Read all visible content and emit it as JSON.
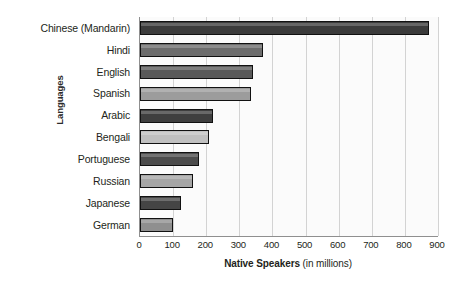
{
  "chart_data": {
    "type": "bar",
    "orientation": "horizontal",
    "title": "",
    "xlabel_bold": "Native Speakers",
    "xlabel_light": "(in millions)",
    "ylabel": "Languages",
    "xlim": [
      0,
      900
    ],
    "xticks": [
      0,
      100,
      200,
      300,
      400,
      500,
      600,
      700,
      800,
      900
    ],
    "xtick_labels": [
      "0",
      "100",
      "200",
      "300",
      "400",
      "500",
      "600",
      "700",
      "800",
      "900"
    ],
    "grid": "vertical",
    "legend": "none",
    "categories": [
      "Chinese (Mandarin)",
      "Hindi",
      "English",
      "Spanish",
      "Arabic",
      "Bengali",
      "Portuguese",
      "Russian",
      "Japanese",
      "German"
    ],
    "values": [
      873,
      370,
      341,
      334,
      221,
      207,
      177,
      160,
      125,
      100
    ],
    "bar_colors": [
      "#3b3b3b",
      "#6d6d6d",
      "#595959",
      "#9c9c9c",
      "#3f3f3f",
      "#c0c0c0",
      "#4c4c4c",
      "#a5a5a5",
      "#454545",
      "#8f8f8f"
    ]
  },
  "style": {
    "plot_background": "#fbfbfb",
    "axis_color": "#8f8f8f",
    "gridline_color": "#d3d3d3",
    "text_color": "#231f20",
    "bar_outline": "#111111"
  }
}
